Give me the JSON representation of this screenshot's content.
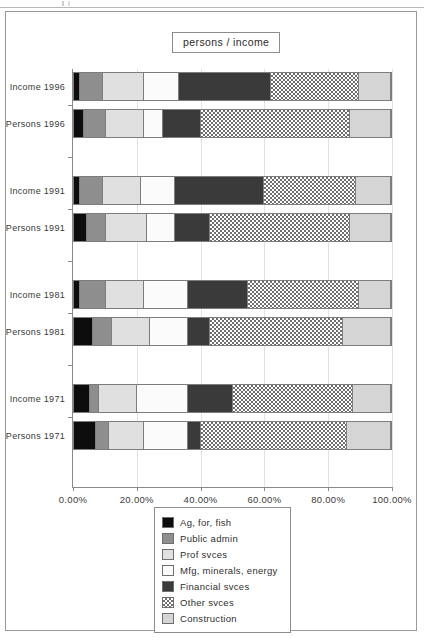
{
  "artifact": {
    "name": "scan-artifact"
  },
  "chart_data": {
    "type": "bar",
    "orientation": "horizontal",
    "stacked": true,
    "stack_normalized": true,
    "title": "persons / income",
    "xlabel": "",
    "ylabel": "",
    "xlim": [
      0,
      100
    ],
    "xtick_values": [
      0,
      20,
      40,
      60,
      80,
      100
    ],
    "xtick_labels": [
      "0.00%",
      "20.00%",
      "40.00%",
      "60.00%",
      "80.00%",
      "100.00%"
    ],
    "grid": true,
    "legend_position": "bottom-center",
    "categories": [
      "Income 1996",
      "Persons 1996",
      "Income 1991",
      "Persons 1991",
      "Income 1981",
      "Persons 1981",
      "Income 1971",
      "Persons 1971"
    ],
    "series": [
      {
        "name": "Ag, for, fish",
        "key": "ag",
        "fill": "solid-black",
        "color": "#0d0d0d",
        "values": [
          2.0,
          3.0,
          2.0,
          4.0,
          2.0,
          6.0,
          5.0,
          7.0
        ]
      },
      {
        "name": "Public admin",
        "key": "pub",
        "fill": "solid-gray",
        "color": "#8e8e8e",
        "values": [
          7.0,
          7.0,
          7.0,
          6.0,
          8.0,
          6.0,
          3.0,
          4.0
        ]
      },
      {
        "name": "Prof svces",
        "key": "prof",
        "fill": "solid-lightgray",
        "color": "#e0e0e0",
        "values": [
          13.0,
          12.0,
          12.0,
          13.0,
          12.0,
          12.0,
          12.0,
          11.0
        ]
      },
      {
        "name": "Mfg, minerals, energy",
        "key": "mfg",
        "fill": "solid-white",
        "color": "#fbfbfb",
        "values": [
          11.0,
          6.0,
          11.0,
          9.0,
          14.0,
          12.0,
          16.0,
          14.0
        ]
      },
      {
        "name": "Financial svces",
        "key": "fin",
        "fill": "solid-darkgray",
        "color": "#3a3a3a",
        "values": [
          29.0,
          12.0,
          28.0,
          11.0,
          19.0,
          7.0,
          14.0,
          4.0
        ]
      },
      {
        "name": "Other svces",
        "key": "other",
        "fill": "checkerboard",
        "color": "#6f6f6f",
        "values": [
          28.0,
          47.0,
          29.0,
          44.0,
          35.0,
          42.0,
          38.0,
          46.0
        ]
      },
      {
        "name": "Construction",
        "key": "con",
        "fill": "solid-silver",
        "color": "#d5d5d5",
        "values": [
          10.0,
          13.0,
          11.0,
          13.0,
          10.0,
          15.0,
          12.0,
          14.0
        ]
      }
    ]
  }
}
